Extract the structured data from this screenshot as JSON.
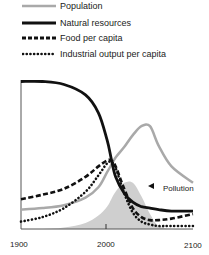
{
  "chart_data": {
    "type": "line",
    "title": "",
    "xlabel": "",
    "ylabel": "",
    "xlim": [
      1900,
      2100
    ],
    "ylim": [
      0,
      1
    ],
    "grid": false,
    "legend_position": "top",
    "x_ticks": [
      "1900",
      "2000",
      "2100"
    ],
    "x": [
      1900,
      1925,
      1950,
      1975,
      1990,
      2000,
      2005,
      2010,
      2020,
      2030,
      2040,
      2050,
      2060,
      2075,
      2100
    ],
    "series": [
      {
        "name": "Population",
        "style": "solid-gray",
        "values": [
          0.13,
          0.14,
          0.16,
          0.21,
          0.28,
          0.38,
          0.43,
          0.48,
          0.55,
          0.63,
          0.69,
          0.69,
          0.56,
          0.42,
          0.31
        ]
      },
      {
        "name": "Natural resources",
        "style": "solid-black",
        "values": [
          0.99,
          0.99,
          0.97,
          0.9,
          0.78,
          0.6,
          0.47,
          0.35,
          0.24,
          0.18,
          0.15,
          0.14,
          0.13,
          0.12,
          0.12
        ]
      },
      {
        "name": "Food per capita",
        "style": "dashed",
        "values": [
          0.2,
          0.23,
          0.27,
          0.35,
          0.42,
          0.46,
          0.46,
          0.42,
          0.27,
          0.14,
          0.08,
          0.06,
          0.06,
          0.07,
          0.1
        ]
      },
      {
        "name": "Industrial output per capita",
        "style": "dotted",
        "values": [
          0.05,
          0.08,
          0.14,
          0.25,
          0.36,
          0.44,
          0.45,
          0.41,
          0.24,
          0.11,
          0.05,
          0.03,
          0.02,
          0.02,
          0.02
        ]
      },
      {
        "name": "Pollution",
        "style": "filled-gray-area",
        "values": [
          0,
          0,
          0.01,
          0.04,
          0.09,
          0.15,
          0.2,
          0.25,
          0.31,
          0.31,
          0.22,
          0.1,
          0.02,
          0,
          0
        ]
      }
    ],
    "annotations": [
      {
        "text": "Pollution",
        "x": 2035,
        "y": 0.29
      }
    ]
  },
  "legend": {
    "items": [
      {
        "label": "Population"
      },
      {
        "label": "Natural resources"
      },
      {
        "label": "Food per capita"
      },
      {
        "label": "Industrial output per capita"
      }
    ]
  },
  "axis": {
    "ticks": [
      "1900",
      "2000",
      "2100"
    ]
  },
  "annotation": {
    "pollution": "Pollution"
  },
  "colors": {
    "population": "#a9a9a9",
    "resources": "#111111",
    "food": "#111111",
    "industry": "#111111",
    "pollution_fill": "#cfcfcf"
  }
}
